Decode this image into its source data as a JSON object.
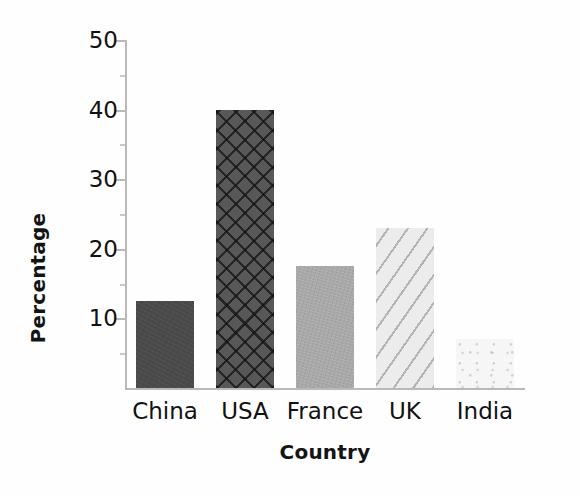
{
  "chart_data": {
    "type": "bar",
    "title": "",
    "xlabel": "Country",
    "ylabel": "Percentage",
    "categories": [
      "China",
      "USA",
      "France",
      "UK",
      "India"
    ],
    "values": [
      12.5,
      40,
      17.5,
      23,
      7
    ],
    "ylim": [
      0,
      50
    ],
    "yticks": [
      10,
      20,
      30,
      40,
      50
    ],
    "ytick_labels": [
      "10",
      "20",
      "30",
      "40",
      "50"
    ],
    "minor_yticks": [
      5,
      15,
      25,
      35,
      45
    ],
    "grid": false,
    "legend": null,
    "series": [
      {
        "name": "Percentage",
        "values": [
          12.5,
          40,
          17.5,
          23,
          7
        ]
      }
    ],
    "bar_styles": [
      {
        "category": "China",
        "fill": "#4a4a4a",
        "pattern": "solid-dark"
      },
      {
        "category": "USA",
        "fill": "#585858",
        "pattern": "crosshatch-diamond"
      },
      {
        "category": "France",
        "fill": "#a8a8a8",
        "pattern": "solid-medium-gray"
      },
      {
        "category": "UK",
        "fill": "#ececec",
        "pattern": "diagonal-stripes"
      },
      {
        "category": "India",
        "fill": "#f6f6f6",
        "pattern": "light-speckled"
      }
    ],
    "axis_color": "#b9b9b9",
    "text_color": "#111111",
    "background": "#fefefe"
  }
}
